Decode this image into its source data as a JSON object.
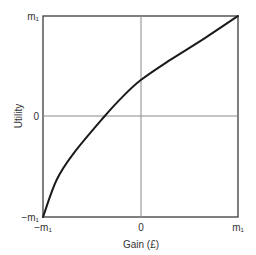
{
  "chart_data": {
    "type": "line",
    "title": "",
    "xlabel": "Gain (£)",
    "ylabel": "Utility",
    "xlim": [
      -1,
      1
    ],
    "ylim": [
      -1,
      1
    ],
    "x_ticks": [
      "−m₁",
      "0",
      "m₁"
    ],
    "y_ticks": [
      "−m₁",
      "0",
      "m₁"
    ],
    "grid": "zero-lines only",
    "legend": null,
    "units_note": "values normalised so that m₁ = 1",
    "series": [
      {
        "name": "Utility function (concave)",
        "color": "#1a1a1a",
        "x": [
          -1.0,
          -0.86,
          -0.68,
          -0.37,
          -0.19,
          0.0,
          0.3,
          0.66,
          1.0
        ],
        "y": [
          -1.0,
          -0.63,
          -0.36,
          0.0,
          0.19,
          0.36,
          0.56,
          0.78,
          1.0
        ]
      }
    ]
  },
  "colors": {
    "frame": "#2b2b2b",
    "zero_lines": "#8a8a8a",
    "curve": "#1a1a1a",
    "text": "#333333"
  }
}
